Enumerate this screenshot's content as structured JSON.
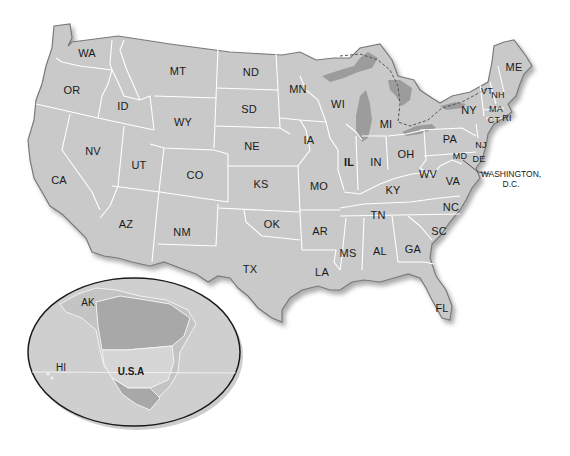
{
  "map": {
    "title": "United States map with state abbreviations",
    "colors": {
      "land": "#c9c9c9",
      "border": "#ffffff",
      "coast": "#7a7a7a",
      "shadow": "#b0b0b0",
      "lakes": "#9c9c9c",
      "canada_inset": "#a8a8a8",
      "background": "#ffffff"
    },
    "states": [
      {
        "abbr": "WA",
        "x": 87,
        "y": 53
      },
      {
        "abbr": "OR",
        "x": 72,
        "y": 90
      },
      {
        "abbr": "CA",
        "x": 59,
        "y": 180
      },
      {
        "abbr": "NV",
        "x": 93,
        "y": 151
      },
      {
        "abbr": "ID",
        "x": 123,
        "y": 106
      },
      {
        "abbr": "MT",
        "x": 178,
        "y": 71
      },
      {
        "abbr": "WY",
        "x": 183,
        "y": 122
      },
      {
        "abbr": "UT",
        "x": 139,
        "y": 165
      },
      {
        "abbr": "AZ",
        "x": 126,
        "y": 224
      },
      {
        "abbr": "CO",
        "x": 195,
        "y": 175
      },
      {
        "abbr": "NM",
        "x": 182,
        "y": 232
      },
      {
        "abbr": "ND",
        "x": 251,
        "y": 72
      },
      {
        "abbr": "SD",
        "x": 249,
        "y": 109
      },
      {
        "abbr": "NE",
        "x": 252,
        "y": 146
      },
      {
        "abbr": "KS",
        "x": 261,
        "y": 184
      },
      {
        "abbr": "OK",
        "x": 272,
        "y": 224
      },
      {
        "abbr": "TX",
        "x": 250,
        "y": 269
      },
      {
        "abbr": "MN",
        "x": 298,
        "y": 89
      },
      {
        "abbr": "IA",
        "x": 309,
        "y": 140
      },
      {
        "abbr": "MO",
        "x": 319,
        "y": 186
      },
      {
        "abbr": "AR",
        "x": 320,
        "y": 231
      },
      {
        "abbr": "LA",
        "x": 322,
        "y": 272
      },
      {
        "abbr": "WI",
        "x": 338,
        "y": 104
      },
      {
        "abbr": "IL",
        "x": 349,
        "y": 162,
        "bold": true
      },
      {
        "abbr": "MI",
        "x": 386,
        "y": 124
      },
      {
        "abbr": "IN",
        "x": 376,
        "y": 162
      },
      {
        "abbr": "OH",
        "x": 406,
        "y": 154
      },
      {
        "abbr": "KY",
        "x": 393,
        "y": 190
      },
      {
        "abbr": "TN",
        "x": 378,
        "y": 215
      },
      {
        "abbr": "MS",
        "x": 348,
        "y": 253
      },
      {
        "abbr": "AL",
        "x": 380,
        "y": 251
      },
      {
        "abbr": "GA",
        "x": 413,
        "y": 249
      },
      {
        "abbr": "FL",
        "x": 442,
        "y": 308
      },
      {
        "abbr": "SC",
        "x": 439,
        "y": 231
      },
      {
        "abbr": "NC",
        "x": 451,
        "y": 207
      },
      {
        "abbr": "VA",
        "x": 453,
        "y": 181
      },
      {
        "abbr": "WV",
        "x": 428,
        "y": 174
      },
      {
        "abbr": "PA",
        "x": 450,
        "y": 139
      },
      {
        "abbr": "NY",
        "x": 469,
        "y": 110
      },
      {
        "abbr": "MD",
        "x": 460,
        "y": 156,
        "small": true
      },
      {
        "abbr": "DE",
        "x": 479,
        "y": 159,
        "small": true
      },
      {
        "abbr": "NJ",
        "x": 481,
        "y": 145,
        "small": true
      },
      {
        "abbr": "CT",
        "x": 494,
        "y": 120,
        "small": true
      },
      {
        "abbr": "RI",
        "x": 507,
        "y": 118,
        "small": true
      },
      {
        "abbr": "MA",
        "x": 496,
        "y": 109,
        "small": true
      },
      {
        "abbr": "VT",
        "x": 487,
        "y": 91,
        "small": true
      },
      {
        "abbr": "NH",
        "x": 498,
        "y": 95,
        "small": true
      },
      {
        "abbr": "ME",
        "x": 514,
        "y": 67
      }
    ],
    "capital": {
      "label_line1": "WASHINGTON,",
      "label_line2": "D.C.",
      "x": 511,
      "y": 169
    },
    "inset": {
      "name": "North America locator globe",
      "labels": [
        {
          "text": "AK",
          "x": 88,
          "y": 302
        },
        {
          "text": "HI",
          "x": 61,
          "y": 367
        },
        {
          "text": "U.S.A",
          "x": 131,
          "y": 371,
          "bold": true
        }
      ]
    }
  }
}
